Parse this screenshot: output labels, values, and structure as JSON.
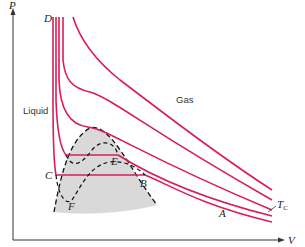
{
  "diagram": {
    "axes": {
      "y_label": "P",
      "x_label": "V"
    },
    "regions": {
      "liquid": "Liquid",
      "gas": "Gas"
    },
    "points": {
      "D": "D",
      "C": "C",
      "B": "B",
      "E": "E",
      "F": "F",
      "A": "A"
    },
    "critical_label": {
      "main": "T",
      "sub": "C"
    },
    "colors": {
      "isotherm": "#d4205a",
      "dome_fill": "#d9d9d9",
      "dashed": "#111111",
      "axis": "#333333"
    },
    "isotherm_count": 5
  }
}
